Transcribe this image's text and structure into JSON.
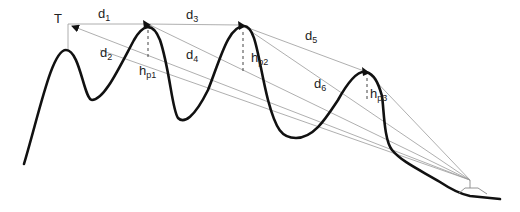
{
  "diagram": {
    "transmitter_label": "T",
    "distances": [
      {
        "base": "d",
        "sub": "1"
      },
      {
        "base": "d",
        "sub": "2"
      },
      {
        "base": "d",
        "sub": "3"
      },
      {
        "base": "d",
        "sub": "4"
      },
      {
        "base": "d",
        "sub": "5"
      },
      {
        "base": "d",
        "sub": "6"
      }
    ],
    "heights": [
      {
        "base": "h",
        "sub": "p1"
      },
      {
        "base": "h",
        "sub": "p2"
      },
      {
        "base": "h",
        "sub": "p3"
      }
    ],
    "colors": {
      "terrain": "#111111",
      "rays": "#9a9a9a",
      "background": "#ffffff"
    }
  }
}
